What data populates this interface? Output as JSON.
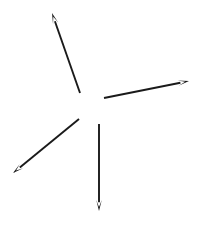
{
  "figure": {
    "background_color": "#ffffff",
    "width": 200,
    "height": 229,
    "stroke_color": "#1a1a1a",
    "arrow_count": 4
  },
  "chart_data": {
    "type": "scatter",
    "xlabel": "",
    "ylabel": "",
    "xlim": [
      0,
      200
    ],
    "ylim": [
      0,
      229
    ],
    "grid": false,
    "legend": "none",
    "series": [
      {
        "name": "arrow-upper-left",
        "direction_deg": 108,
        "tail": [
          80,
          93
        ],
        "tip": [
          52,
          13
        ],
        "length_px": 84.8,
        "stroke_width": 1.9,
        "head_length": 11,
        "head_width": 5.5
      },
      {
        "name": "arrow-right",
        "direction_deg": 11,
        "tail": [
          104,
          98
        ],
        "tip": [
          189,
          81
        ],
        "length_px": 86.7,
        "stroke_width": 1.9,
        "head_length": 11,
        "head_width": 5.5
      },
      {
        "name": "arrow-lower-left",
        "direction_deg": 215,
        "tail": [
          79,
          119
        ],
        "tip": [
          13,
          173
        ],
        "length_px": 85.3,
        "stroke_width": 1.9,
        "head_length": 11,
        "head_width": 5.5
      },
      {
        "name": "arrow-down",
        "direction_deg": 270,
        "tail": [
          99,
          124
        ],
        "tip": [
          99,
          211
        ],
        "length_px": 87,
        "stroke_width": 1.9,
        "head_length": 11,
        "head_width": 5.5
      }
    ]
  }
}
